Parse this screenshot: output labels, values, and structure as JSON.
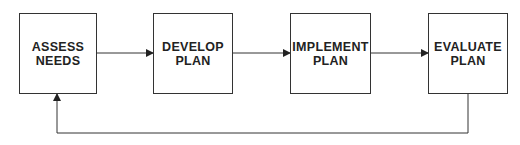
{
  "diagram": {
    "type": "flowchart",
    "nodes": [
      {
        "id": "assess",
        "label": "ASSESS\nNEEDS"
      },
      {
        "id": "develop",
        "label": "DEVELOP\nPLAN"
      },
      {
        "id": "implement",
        "label": "IMPLEMENT\nPLAN"
      },
      {
        "id": "evaluate",
        "label": "EVALUATE\nPLAN"
      }
    ],
    "edges": [
      {
        "from": "assess",
        "to": "develop"
      },
      {
        "from": "develop",
        "to": "implement"
      },
      {
        "from": "implement",
        "to": "evaluate"
      },
      {
        "from": "evaluate",
        "to": "assess",
        "style": "feedback-loop"
      }
    ],
    "colors": {
      "stroke": "#333333",
      "text": "#222222",
      "background": "#ffffff"
    }
  }
}
